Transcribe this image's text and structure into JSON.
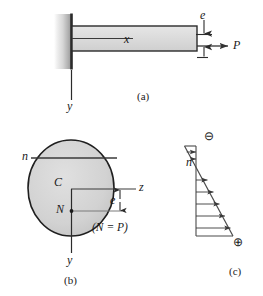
{
  "figure": {
    "colors": {
      "ink": "#1a1a1a",
      "line": "#333333",
      "bar_fill": "#d9d9d9",
      "section_fill": "#d2d2d2",
      "wall_light": "#f2f2f2",
      "wall_dark": "#a8a8a8",
      "wall_edge": "#2b2b2b",
      "thin_line": "#555555"
    },
    "panels": [
      {
        "id": "a",
        "caption": "(a)",
        "description": "Cantilever bar fixed at a wall, loaded by an axial force P applied at eccentricity e",
        "labels": [
          {
            "name": "axis-x-label",
            "text": "x"
          },
          {
            "name": "eccentricity-label",
            "text": "e"
          },
          {
            "name": "force-label",
            "text": "P"
          },
          {
            "name": "axis-y-label",
            "text": "y"
          }
        ]
      },
      {
        "id": "b",
        "caption": "(b)",
        "description": "Elliptical cross section showing centroid C, neutral axis n-n, axis z, force point N at eccentricity e",
        "labels": [
          {
            "name": "neutral-axis-label",
            "text": "n"
          },
          {
            "name": "centroid-label",
            "text": "C"
          },
          {
            "name": "axis-z-label",
            "text": "z"
          },
          {
            "name": "force-point-label",
            "text": "N"
          },
          {
            "name": "eccentricity-label",
            "text": "e"
          },
          {
            "name": "axis-y-label",
            "text": "y"
          },
          {
            "name": "force-equation",
            "text": "(N = P)"
          }
        ]
      },
      {
        "id": "c",
        "caption": "(c)",
        "description": "Linear normal stress distribution over the section: compression above the neutral axis, tension below",
        "labels": [
          {
            "name": "neutral-axis-label",
            "text": "n"
          },
          {
            "name": "compression-sign",
            "text": "⊖"
          },
          {
            "name": "tension-sign",
            "text": "⊕"
          }
        ],
        "stress_profile": {
          "type": "linear",
          "neutral_axis_position_fraction": 0.22,
          "negative_peak_label": "⊖",
          "positive_peak_label": "⊕",
          "negative_arrow_count": 2,
          "positive_arrow_count": 5
        }
      }
    ]
  }
}
